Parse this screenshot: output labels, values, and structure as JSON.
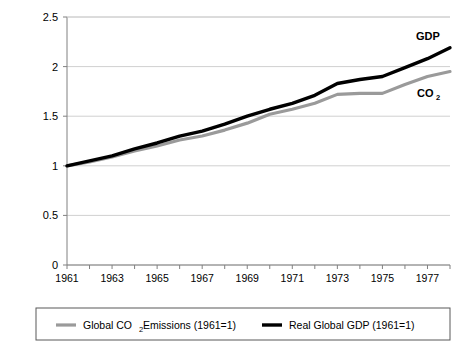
{
  "chart_data": {
    "type": "line",
    "title": "",
    "xlabel": "",
    "ylabel": "",
    "xlim": [
      1961,
      1978
    ],
    "ylim": [
      0,
      2.5
    ],
    "grid": "horizontal",
    "legend_position": "bottom",
    "y_ticks": [
      "0",
      "0.5",
      "1",
      "1.5",
      "2",
      "2.5"
    ],
    "y_tick_values": [
      0,
      0.5,
      1,
      1.5,
      2,
      2.5
    ],
    "x_ticks": [
      "1961",
      "1963",
      "1965",
      "1967",
      "1969",
      "1971",
      "1973",
      "1975",
      "1977"
    ],
    "x_tick_values": [
      1961,
      1963,
      1965,
      1967,
      1969,
      1971,
      1973,
      1975,
      1977
    ],
    "x": [
      1961,
      1962,
      1963,
      1964,
      1965,
      1966,
      1967,
      1968,
      1969,
      1970,
      1971,
      1972,
      1973,
      1974,
      1975,
      1976,
      1977,
      1978
    ],
    "series": [
      {
        "name": "Global CO2 Emissions (1961=1)",
        "short_label": "CO2",
        "color": "#9a9a9a",
        "values": [
          1.0,
          1.04,
          1.09,
          1.15,
          1.2,
          1.26,
          1.3,
          1.36,
          1.43,
          1.52,
          1.57,
          1.63,
          1.72,
          1.73,
          1.73,
          1.82,
          1.9,
          1.95
        ]
      },
      {
        "name": "Real Global GDP (1961=1)",
        "short_label": "GDP",
        "color": "#000000",
        "values": [
          1.0,
          1.05,
          1.1,
          1.17,
          1.23,
          1.3,
          1.35,
          1.42,
          1.5,
          1.57,
          1.63,
          1.71,
          1.83,
          1.87,
          1.9,
          1.99,
          2.08,
          2.19
        ]
      }
    ],
    "annotations": [
      {
        "text": "GDP",
        "series": "Real Global GDP (1961=1)"
      },
      {
        "text": "CO",
        "subscript": "2",
        "series": "Global CO2 Emissions (1961=1)"
      }
    ]
  },
  "legend": {
    "items": [
      {
        "label_part1": "Global CO",
        "label_sub": "2",
        "label_part2": " Emissions (1961=1)",
        "color": "#9a9a9a"
      },
      {
        "label_part1": "Real Global GDP (1961=1)",
        "label_sub": "",
        "label_part2": "",
        "color": "#000000"
      }
    ]
  },
  "axis_annotations": {
    "gdp_label": "GDP",
    "co2_label": "CO",
    "co2_sub": "2"
  },
  "colors": {
    "gridline": "#d0d0d0",
    "axis": "#808080",
    "plot_background": "#ffffff",
    "legend_border": "#595959"
  }
}
